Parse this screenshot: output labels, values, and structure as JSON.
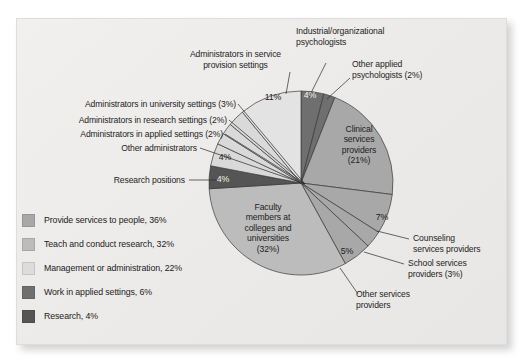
{
  "chart_data": {
    "type": "pie",
    "title": "",
    "legend_position": "bottom-left",
    "categories": [
      "Industrial/organizational psychologists",
      "Other applied psychologists",
      "Clinical services providers",
      "Counseling services providers",
      "School services providers",
      "Other services providers",
      "Faculty members at colleges and universities",
      "Research positions",
      "Other administrators",
      "Administrators in applied settings",
      "Administrators in research settings",
      "Administrators in university settings",
      "Administrators in service provision settings"
    ],
    "values": [
      4,
      2,
      21,
      7,
      3,
      5,
      32,
      4,
      4,
      2,
      2,
      3,
      11
    ],
    "units": "percent",
    "total": 100
  },
  "slices": [
    {
      "id": "io-psych",
      "label": "Industrial/organizational psychologists",
      "pct": 4,
      "pct_text": "4%",
      "color": "#6f6f6f"
    },
    {
      "id": "other-applied",
      "label": "Other applied psychologists (2%)",
      "pct": 2,
      "pct_text": "2%",
      "color": "#6f6f6f"
    },
    {
      "id": "clinical",
      "label": "Clinical services providers (21%)",
      "pct": 21,
      "pct_text": "21%",
      "color": "#a8a8a8"
    },
    {
      "id": "counseling",
      "label": "Counseling services providers",
      "pct": 7,
      "pct_text": "7%",
      "color": "#a8a8a8"
    },
    {
      "id": "school",
      "label": "School services providers (3%)",
      "pct": 3,
      "pct_text": "3%",
      "color": "#a8a8a8"
    },
    {
      "id": "other-services",
      "label": "Other services providers",
      "pct": 5,
      "pct_text": "5%",
      "color": "#a8a8a8"
    },
    {
      "id": "faculty",
      "label": "Faculty members at colleges and universities (32%)",
      "pct": 32,
      "pct_text": "32%",
      "color": "#bcbcbc"
    },
    {
      "id": "research-pos",
      "label": "Research positions",
      "pct": 4,
      "pct_text": "4%",
      "color": "#555555"
    },
    {
      "id": "other-admin",
      "label": "Other administrators",
      "pct": 4,
      "pct_text": "4%",
      "color": "#d9d9d9"
    },
    {
      "id": "admin-applied",
      "label": "Administrators in applied settings (2%)",
      "pct": 2,
      "pct_text": "2%",
      "color": "#d9d9d9"
    },
    {
      "id": "admin-research",
      "label": "Administrators in research settings (2%)",
      "pct": 2,
      "pct_text": "2%",
      "color": "#d9d9d9"
    },
    {
      "id": "admin-university",
      "label": "Administrators in university settings (3%)",
      "pct": 3,
      "pct_text": "3%",
      "color": "#d9d9d9"
    },
    {
      "id": "admin-service",
      "label": "Administrators in service provision settings",
      "pct": 11,
      "pct_text": "11%",
      "color": "#e3e3e3"
    }
  ],
  "callouts": {
    "io_psych": "Industrial/organizational\npsychologists",
    "other_applied": "Other applied\npsychologists (2%)",
    "admin_service": "Administrators in service\nprovision settings",
    "admin_university": "Administrators in university settings (3%)",
    "admin_research": "Administrators in research settings (2%)",
    "admin_applied": "Administrators in applied settings (2%)",
    "other_admin": "Other administrators",
    "research_pos": "Research positions",
    "counseling": "Counseling\nservices providers",
    "school": "School services\nproviders (3%)",
    "other_services": "Other services\nproviders"
  },
  "inside_labels": {
    "clinical": "Clinical\nservices\nproviders\n(21%)",
    "faculty": "Faculty\nmembers at\ncolleges and\nuniversities\n(32%)"
  },
  "pct_labels": {
    "io_psych": "4%",
    "admin_service": "11%",
    "other_admin": "4%",
    "research_pos": "4%",
    "counseling": "7%",
    "other_services": "5%"
  },
  "legend": {
    "items": [
      {
        "label": "Provide services to people, 36%",
        "color": "#a8a8a8"
      },
      {
        "label": "Teach and conduct research, 32%",
        "color": "#bcbcbc"
      },
      {
        "label": "Management or administration, 22%",
        "color": "#dcdcdc"
      },
      {
        "label": "Work in applied settings, 6%",
        "color": "#6f6f6f"
      },
      {
        "label": "Research, 4%",
        "color": "#555555"
      }
    ]
  },
  "geometry": {
    "center_x": 301,
    "center_y": 183,
    "radius": 92
  }
}
